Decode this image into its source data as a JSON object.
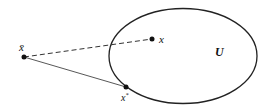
{
  "diagram": {
    "set": {
      "label": "U",
      "cx": 183,
      "cy": 56,
      "rx": 74,
      "ry": 47.5,
      "stroke": "#222222"
    },
    "points": [
      {
        "id": "xbar",
        "label": "x̄",
        "x": 24,
        "y": 57
      },
      {
        "id": "x",
        "label": "x",
        "x": 152,
        "y": 39
      },
      {
        "id": "xstar",
        "label": "x*",
        "x": 126,
        "y": 87
      }
    ],
    "edges": [
      {
        "from": "xbar",
        "to": "x",
        "style": "dashed"
      },
      {
        "from": "xbar",
        "to": "xstar",
        "style": "solid"
      }
    ],
    "labels": {
      "U": "U",
      "x": "x",
      "xbar": "x̄",
      "xstar_base": "x",
      "xstar_sup": "*"
    }
  }
}
